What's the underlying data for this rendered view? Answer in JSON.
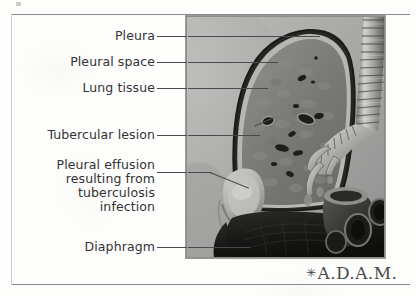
{
  "figure": {
    "type": "medical-illustration",
    "subject": "Pleural effusion resulting from tuberculosis infection",
    "labels": [
      {
        "id": "pleura",
        "text": "Pleura"
      },
      {
        "id": "pleural-space",
        "text": "Pleural space"
      },
      {
        "id": "lung-tissue",
        "text": "Lung tissue"
      },
      {
        "id": "tubercular-lesion",
        "text": "Tubercular lesion"
      },
      {
        "id": "pleural-effusion",
        "text": "Pleural effusion\nresulting from\ntuberculosis\ninfection"
      },
      {
        "id": "diaphragm",
        "text": "Diaphragm"
      }
    ]
  },
  "logo": {
    "star": "✳",
    "text": "A.D.A.M."
  },
  "colors": {
    "label_text": "#333333",
    "leader_line": "#4a4a4a",
    "page_rule": "#8a8a8a",
    "panel_background": "#a8a8a6",
    "lung_tissue": "#7c7c7a",
    "pleura_outline": "#2b2b2b",
    "effusion": "#b9b9b6",
    "diaphragm": "#1d1d1d"
  }
}
